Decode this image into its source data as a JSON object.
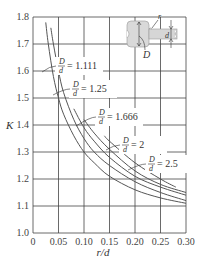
{
  "chart_data": {
    "type": "line",
    "title": "",
    "xlabel": "r/d",
    "ylabel": "K",
    "xlim": [
      0,
      0.3
    ],
    "ylim": [
      1.0,
      1.8
    ],
    "grid": true,
    "x_ticks": [
      "0",
      "0.05",
      "0.10",
      "0.15",
      "0.20",
      "0.25",
      "0.30"
    ],
    "y_ticks": [
      "1.0",
      "1.1",
      "1.2",
      "1.3",
      "1.4",
      "1.5",
      "1.6",
      "1.7",
      "1.8"
    ],
    "legend": "inline curve labels",
    "series": [
      {
        "name": "D/d = 1.111",
        "label_value": "1.111",
        "x": [
          0.025,
          0.03,
          0.04,
          0.05,
          0.06,
          0.08,
          0.1,
          0.12,
          0.15,
          0.2,
          0.25,
          0.3
        ],
        "y": [
          1.78,
          1.7,
          1.58,
          1.5,
          1.44,
          1.36,
          1.3,
          1.26,
          1.21,
          1.16,
          1.13,
          1.11
        ]
      },
      {
        "name": "D/d = 1.25",
        "label_value": "1.25",
        "x": [
          0.035,
          0.04,
          0.05,
          0.06,
          0.08,
          0.1,
          0.12,
          0.15,
          0.2,
          0.25,
          0.3
        ],
        "y": [
          1.76,
          1.7,
          1.6,
          1.52,
          1.42,
          1.35,
          1.3,
          1.25,
          1.19,
          1.15,
          1.12
        ]
      },
      {
        "name": "D/d = 1.666",
        "label_value": "1.666",
        "x": [
          0.08,
          0.1,
          0.12,
          0.15,
          0.2,
          0.25,
          0.3
        ],
        "y": [
          1.46,
          1.39,
          1.34,
          1.28,
          1.21,
          1.17,
          1.14
        ]
      },
      {
        "name": "D/d = 2",
        "label_value": "2",
        "x": [
          0.1,
          0.12,
          0.15,
          0.2,
          0.25,
          0.3
        ],
        "y": [
          1.42,
          1.37,
          1.31,
          1.23,
          1.18,
          1.15
        ]
      },
      {
        "name": "D/d = 2.5",
        "label_value": "2.5",
        "x": [
          0.14,
          0.15,
          0.2,
          0.25,
          0.28
        ],
        "y": [
          1.36,
          1.34,
          1.26,
          1.2,
          1.17
        ]
      }
    ],
    "annotations": [
      "D/d = 1.111",
      "D/d = 1.25",
      "D/d = 1.666",
      "D/d = 2",
      "D/d = 2.5"
    ],
    "inset_figure": {
      "description": "stepped shaft with fillet",
      "labels": [
        "r",
        "d",
        "D"
      ]
    }
  },
  "labels": {
    "ylabel": "K",
    "xlabel": "r/d",
    "frac_num": "D",
    "frac_den": "d",
    "eq": "=",
    "inset_r": "r",
    "inset_d": "d",
    "inset_D": "D"
  }
}
